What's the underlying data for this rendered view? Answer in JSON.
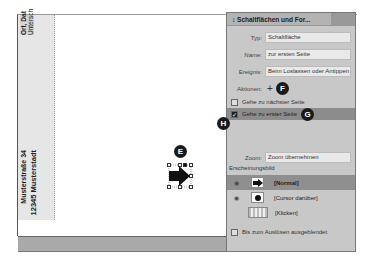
{
  "document": {
    "slug_text_1": "Ort, Dat",
    "slug_text_2": "Untersch",
    "address_line_1": "Musterstraße 34",
    "address_line_2": "12345 Musterstadt"
  },
  "badges": {
    "E": "E",
    "F": "F",
    "G": "G",
    "H": "H"
  },
  "panel": {
    "title": "↕ Schaltflächen und For...",
    "type_label": "Typ:",
    "type_value": "Schaltfläche",
    "name_label": "Name:",
    "name_value": "zur ersten Seite",
    "event_label": "Ereignis:",
    "event_value": "Beim Loslassen oder Antippen",
    "actions_label": "Aktionen:",
    "add_icon": "+",
    "actions": [
      {
        "label": "Gehe zu nächster Seite",
        "checked": false
      },
      {
        "label": "Gehe zu erster Seite",
        "checked": true
      }
    ],
    "zoom_label": "Zoom:",
    "zoom_value": "Zoom übernehmen",
    "appearance_label": "Erscheinungsbild",
    "states": [
      {
        "name": "[Normal]"
      },
      {
        "name": "[Cursor darüber]"
      },
      {
        "name": "[Klicken]"
      }
    ],
    "hidden_label": "Bis zum Auslösen ausgeblendet"
  }
}
